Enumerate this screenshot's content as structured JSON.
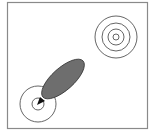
{
  "diagram": {
    "frame": {
      "x": 7,
      "y": 2,
      "width": 141,
      "height": 127,
      "stroke": "#8a8a8a"
    },
    "target_rings": {
      "cx": 116,
      "cy": 37,
      "radii": [
        3,
        8,
        14,
        21
      ],
      "stroke": "#555555"
    },
    "source_rings": {
      "cx": 38,
      "cy": 104,
      "radii": [
        6,
        18
      ],
      "stroke": "#555555"
    },
    "blob": {
      "cx": 62,
      "cy": 79,
      "rx": 28,
      "ry": 12,
      "rotate": -40,
      "fill": "#6e6e6e",
      "stroke": "#333333"
    },
    "arrow": {
      "from": [
        46,
        94
      ],
      "to": [
        38,
        104
      ],
      "color": "#111111"
    }
  }
}
